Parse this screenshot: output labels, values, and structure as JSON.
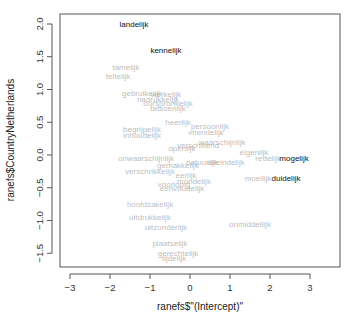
{
  "chart_data": {
    "type": "scatter",
    "title": "",
    "xlabel": "ranefs$\"(Intercept)\"",
    "ylabel": "ranefs$CountryNetherlands",
    "xlim": [
      -3.5,
      3.5
    ],
    "ylim": [
      -1.7,
      2.2
    ],
    "xticks": [
      "-3",
      "-2",
      "-1",
      "0",
      "1",
      "2",
      "3"
    ],
    "xtick_values": [
      -3,
      -2,
      -1,
      0,
      1,
      2,
      3
    ],
    "yticks": [
      "-1.5",
      "-1.0",
      "-0.5",
      "0.0",
      "0.5",
      "1.0",
      "1.5",
      "2.0"
    ],
    "ytick_values": [
      -1.5,
      -1.0,
      -0.5,
      0.0,
      0.5,
      1.0,
      1.5,
      2.0
    ],
    "grid": false,
    "colors": {
      "highlight": "#111111",
      "muted": "#aaaaaa"
    },
    "points": [
      {
        "label": "landelijk",
        "x": -1.4,
        "y": 2.0,
        "highlight": true
      },
      {
        "label": "kennelijk",
        "x": -0.6,
        "y": 1.6,
        "highlight": true
      },
      {
        "label": "mogelijk",
        "x": 2.6,
        "y": -0.05,
        "highlight": true
      },
      {
        "label": "duidelijk",
        "x": 2.4,
        "y": -0.35,
        "highlight": true
      },
      {
        "label": "tamelijk",
        "x": -1.6,
        "y": 1.35,
        "highlight": false
      },
      {
        "label": "feitelijk",
        "x": -1.8,
        "y": 1.2,
        "highlight": false
      },
      {
        "label": "gebruikelijk",
        "x": -1.2,
        "y": 0.95,
        "highlight": false
      },
      {
        "label": "werkelijk",
        "x": -0.6,
        "y": 0.93,
        "highlight": false
      },
      {
        "label": "nadrukkelijk",
        "x": -0.8,
        "y": 0.85,
        "highlight": false
      },
      {
        "label": "oorspronkelijk",
        "x": -0.55,
        "y": 0.8,
        "highlight": false
      },
      {
        "label": "fatsoenlijk",
        "x": -0.55,
        "y": 0.72,
        "highlight": false
      },
      {
        "label": "hoofdzakelijk",
        "x": -1.0,
        "y": -0.75,
        "highlight": false
      },
      {
        "label": "uitdrukkelijk",
        "x": -1.0,
        "y": -0.95,
        "highlight": false
      },
      {
        "label": "uitzonderlijk",
        "x": -0.6,
        "y": -1.1,
        "highlight": false
      },
      {
        "label": "onmiddellijk",
        "x": 1.5,
        "y": -1.05,
        "highlight": false
      },
      {
        "label": "plaatselijk",
        "x": -0.5,
        "y": -1.35,
        "highlight": false
      },
      {
        "label": "gerechtelijk",
        "x": -0.3,
        "y": -1.5,
        "highlight": false
      },
      {
        "label": "tijdelijk",
        "x": -0.4,
        "y": -1.58,
        "highlight": false
      },
      {
        "label": "moeilijk",
        "x": 1.7,
        "y": -0.35,
        "highlight": false
      },
      {
        "label": "eigenlijk",
        "x": 1.6,
        "y": 0.05,
        "highlight": false
      },
      {
        "label": "redelijk",
        "x": 1.95,
        "y": -0.05,
        "highlight": false
      },
      {
        "label": "eenvoudelijk",
        "x": -0.2,
        "y": -0.5,
        "highlight": false
      },
      {
        "label": "begrijpelijk",
        "x": -1.2,
        "y": 0.4,
        "highlight": false
      },
      {
        "label": "inhoudelijk",
        "x": -1.2,
        "y": 0.3,
        "highlight": false
      },
      {
        "label": "onwaarschijnlijk",
        "x": -1.1,
        "y": -0.05,
        "highlight": false
      },
      {
        "label": "verschrikkelijk",
        "x": -1.0,
        "y": -0.25,
        "highlight": false
      },
      {
        "label": "persoonlijk",
        "x": 0.5,
        "y": 0.45,
        "highlight": false
      },
      {
        "label": "waarschijnlijk",
        "x": 0.8,
        "y": 0.2,
        "highlight": false
      },
      {
        "label": "vriendelijk",
        "x": 0.4,
        "y": 0.35,
        "highlight": false
      },
      {
        "label": "verschillend",
        "x": 0.2,
        "y": 0.15,
        "highlight": false
      },
      {
        "label": "openlijk",
        "x": -0.2,
        "y": 0.1,
        "highlight": false
      },
      {
        "label": "heerlijk",
        "x": -0.3,
        "y": 0.5,
        "highlight": false
      },
      {
        "label": "natuurlijk",
        "x": 0.3,
        "y": -0.1,
        "highlight": false
      },
      {
        "label": "gemakkelijk",
        "x": -0.3,
        "y": -0.15,
        "highlight": false
      },
      {
        "label": "uiteindelijk",
        "x": 0.9,
        "y": -0.1,
        "highlight": false
      },
      {
        "label": "eerlijk",
        "x": -0.1,
        "y": -0.3,
        "highlight": false
      },
      {
        "label": "mondelijk",
        "x": 0.1,
        "y": -0.4,
        "highlight": false
      },
      {
        "label": "voorlopig",
        "x": -0.4,
        "y": -0.45,
        "highlight": false
      }
    ]
  }
}
